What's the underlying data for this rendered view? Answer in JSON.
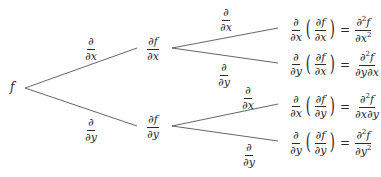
{
  "root": {
    "label": "f"
  },
  "level1": [
    {
      "edge": {
        "num": "∂",
        "den": "∂x"
      },
      "node": {
        "num": "∂f",
        "den": "∂x"
      }
    },
    {
      "edge": {
        "num": "∂",
        "den": "∂y"
      },
      "node": {
        "num": "∂f",
        "den": "∂y"
      }
    }
  ],
  "level2": [
    {
      "edge": {
        "num": "∂",
        "den": "∂x"
      },
      "op": {
        "num": "∂",
        "den": "∂x"
      },
      "inner": {
        "num": "∂f",
        "den": "∂x"
      },
      "eq": "=",
      "result": {
        "num_base": "∂",
        "num_sup": "2",
        "num_tail": "f",
        "den": "∂x",
        "den_sup": "2"
      }
    },
    {
      "edge": {
        "num": "∂",
        "den": "∂y"
      },
      "op": {
        "num": "∂",
        "den": "∂y"
      },
      "inner": {
        "num": "∂f",
        "den": "∂x"
      },
      "eq": "=",
      "result": {
        "num_base": "∂",
        "num_sup": "2",
        "num_tail": "f",
        "den": "∂y∂x",
        "den_sup": ""
      }
    },
    {
      "edge": {
        "num": "∂",
        "den": "∂x"
      },
      "op": {
        "num": "∂",
        "den": "∂x"
      },
      "inner": {
        "num": "∂f",
        "den": "∂y"
      },
      "eq": "=",
      "result": {
        "num_base": "∂",
        "num_sup": "2",
        "num_tail": "f",
        "den": "∂x∂y",
        "den_sup": ""
      }
    },
    {
      "edge": {
        "num": "∂",
        "den": "∂y"
      },
      "op": {
        "num": "∂",
        "den": "∂y"
      },
      "inner": {
        "num": "∂f",
        "den": "∂y"
      },
      "eq": "=",
      "result": {
        "num_base": "∂",
        "num_sup": "2",
        "num_tail": "f",
        "den": "∂y",
        "den_sup": "2"
      }
    }
  ],
  "colors": {
    "line": "#555555",
    "text": "#2a2a2a",
    "background": "#ffffff"
  }
}
